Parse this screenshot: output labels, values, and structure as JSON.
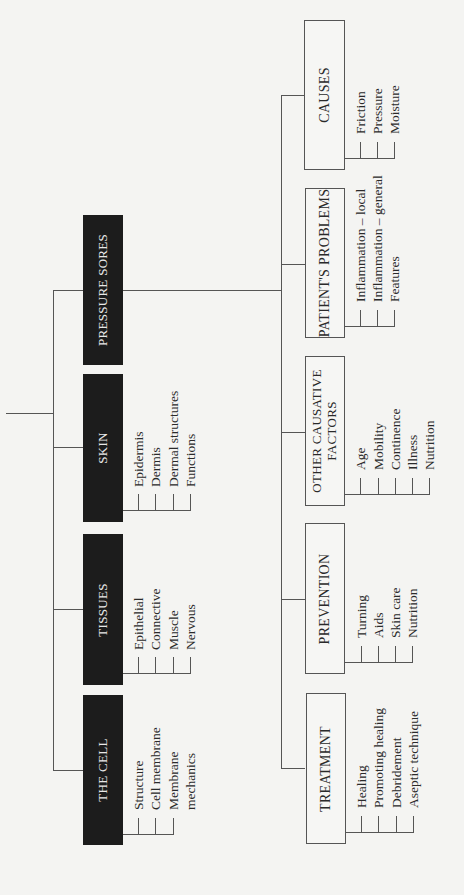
{
  "root": {
    "label": "PRESSURE SORES",
    "left_branch": [
      {
        "label": "THE CELL",
        "items": [
          "Structure",
          "Cell membrane",
          "Membrane",
          "mechanics"
        ]
      },
      {
        "label": "TISSUES",
        "items": [
          "Epithelial",
          "Connective",
          "Muscle",
          "Nervous"
        ]
      },
      {
        "label": "SKIN",
        "items": [
          "Epidermis",
          "Dermis",
          "Dermal structures",
          "Functions"
        ]
      },
      {
        "label": "PRESSURE SORES",
        "items": []
      }
    ],
    "children": [
      {
        "label": "TREATMENT",
        "items": [
          "Healing",
          "Promoting healing",
          "Debridement",
          "Aseptic technique"
        ]
      },
      {
        "label": "PREVENTION",
        "items": [
          "Turning",
          "Aids",
          "Skin care",
          "Nutrition"
        ]
      },
      {
        "label_line1": "OTHER CAUSATIVE",
        "label_line2": "FACTORS",
        "items": [
          "Age",
          "Mobility",
          "Continence",
          "Illness",
          "Nutrition"
        ]
      },
      {
        "label": "PATIENT'S PROBLEMS",
        "items": [
          "Inflammation – local",
          "Inflammation – general",
          "Features"
        ]
      },
      {
        "label": "CAUSES",
        "items": [
          "Friction",
          "Pressure",
          "Moisture"
        ]
      }
    ]
  },
  "colors": {
    "background": "#f4f4f2",
    "dark_box": "#1c1c1c",
    "line": "#555555"
  }
}
